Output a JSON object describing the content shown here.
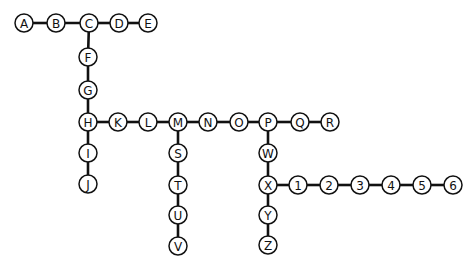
{
  "diagram": {
    "type": "node-link tree",
    "style": {
      "stroke": "#111111",
      "fill": "#ffffff",
      "node_radius": 9
    },
    "nodes": [
      {
        "id": "A",
        "label": "A",
        "x": 24,
        "y": 23
      },
      {
        "id": "B",
        "label": "B",
        "x": 56,
        "y": 23
      },
      {
        "id": "C",
        "label": "C",
        "x": 89,
        "y": 23
      },
      {
        "id": "D",
        "label": "D",
        "x": 119,
        "y": 23
      },
      {
        "id": "E",
        "label": "E",
        "x": 148,
        "y": 23
      },
      {
        "id": "F",
        "label": "F",
        "x": 88,
        "y": 57
      },
      {
        "id": "G",
        "label": "G",
        "x": 88,
        "y": 90
      },
      {
        "id": "H",
        "label": "H",
        "x": 88,
        "y": 122
      },
      {
        "id": "I",
        "label": "I",
        "x": 88,
        "y": 153
      },
      {
        "id": "J",
        "label": "J",
        "x": 88,
        "y": 184
      },
      {
        "id": "K",
        "label": "K",
        "x": 118,
        "y": 122
      },
      {
        "id": "L",
        "label": "L",
        "x": 148,
        "y": 122
      },
      {
        "id": "M",
        "label": "M",
        "x": 178,
        "y": 122
      },
      {
        "id": "N",
        "label": "N",
        "x": 208,
        "y": 122
      },
      {
        "id": "O",
        "label": "O",
        "x": 239,
        "y": 122
      },
      {
        "id": "P",
        "label": "P",
        "x": 268,
        "y": 122
      },
      {
        "id": "Q",
        "label": "Q",
        "x": 300,
        "y": 122
      },
      {
        "id": "R",
        "label": "R",
        "x": 330,
        "y": 122
      },
      {
        "id": "S",
        "label": "S",
        "x": 178,
        "y": 153
      },
      {
        "id": "T",
        "label": "T",
        "x": 178,
        "y": 185
      },
      {
        "id": "U",
        "label": "U",
        "x": 178,
        "y": 215
      },
      {
        "id": "V",
        "label": "V",
        "x": 178,
        "y": 246
      },
      {
        "id": "W",
        "label": "W",
        "x": 268,
        "y": 153
      },
      {
        "id": "X",
        "label": "X",
        "x": 268,
        "y": 185
      },
      {
        "id": "Y",
        "label": "Y",
        "x": 268,
        "y": 215
      },
      {
        "id": "Z",
        "label": "Z",
        "x": 268,
        "y": 245
      },
      {
        "id": "1",
        "label": "1",
        "x": 298,
        "y": 185
      },
      {
        "id": "2",
        "label": "2",
        "x": 329,
        "y": 185
      },
      {
        "id": "3",
        "label": "3",
        "x": 360,
        "y": 185
      },
      {
        "id": "4",
        "label": "4",
        "x": 391,
        "y": 185
      },
      {
        "id": "5",
        "label": "5",
        "x": 422,
        "y": 185
      },
      {
        "id": "6",
        "label": "6",
        "x": 453,
        "y": 185
      }
    ],
    "edges": [
      [
        "A",
        "B"
      ],
      [
        "B",
        "C"
      ],
      [
        "C",
        "D"
      ],
      [
        "D",
        "E"
      ],
      [
        "C",
        "F"
      ],
      [
        "F",
        "G"
      ],
      [
        "G",
        "H"
      ],
      [
        "H",
        "I"
      ],
      [
        "I",
        "J"
      ],
      [
        "H",
        "K"
      ],
      [
        "K",
        "L"
      ],
      [
        "L",
        "M"
      ],
      [
        "M",
        "N"
      ],
      [
        "N",
        "O"
      ],
      [
        "O",
        "P"
      ],
      [
        "P",
        "Q"
      ],
      [
        "Q",
        "R"
      ],
      [
        "M",
        "S"
      ],
      [
        "S",
        "T"
      ],
      [
        "T",
        "U"
      ],
      [
        "U",
        "V"
      ],
      [
        "P",
        "W"
      ],
      [
        "W",
        "X"
      ],
      [
        "X",
        "Y"
      ],
      [
        "Y",
        "Z"
      ],
      [
        "X",
        "1"
      ],
      [
        "1",
        "2"
      ],
      [
        "2",
        "3"
      ],
      [
        "3",
        "4"
      ],
      [
        "4",
        "5"
      ],
      [
        "5",
        "6"
      ]
    ]
  }
}
